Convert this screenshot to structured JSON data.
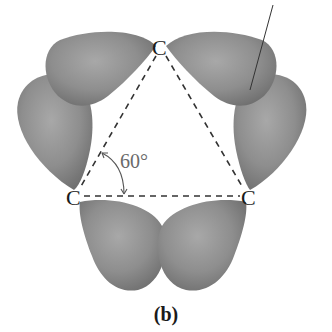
{
  "figure": {
    "caption": "(b)",
    "angle_label": "60°",
    "atoms": [
      {
        "label": "C",
        "position": "top"
      },
      {
        "label": "C",
        "position": "bottom-left"
      },
      {
        "label": "C",
        "position": "bottom-right"
      }
    ],
    "bonds": {
      "style": "dashed",
      "count": 3,
      "description": "C–C internuclear axes forming an equilateral triangle"
    },
    "orbital_lobes": {
      "count": 6,
      "per_bond": 2,
      "shape": "bent (banana) bond lobes bulging outward from triangle",
      "color": "#8c8c8c"
    },
    "leader_line": true
  }
}
